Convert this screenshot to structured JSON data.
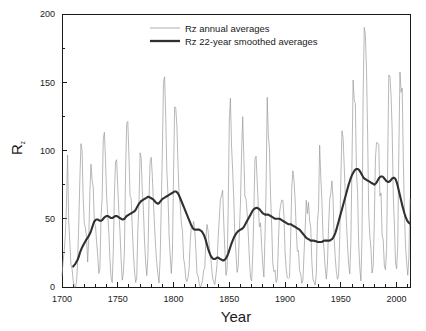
{
  "chart_data": {
    "type": "line",
    "title": "",
    "xlabel": "Year",
    "ylabel": "Rz",
    "ylabel_base": "R",
    "ylabel_sub": "z",
    "xlim": [
      1700,
      2012
    ],
    "ylim": [
      0,
      200
    ],
    "xticks": [
      1700,
      1750,
      1800,
      1850,
      1900,
      1950,
      2000
    ],
    "yticks": [
      0,
      50,
      100,
      150,
      200
    ],
    "xminor_step": 10,
    "yminor_step": 25,
    "grid": false,
    "legend_position": "top-center",
    "colors": {
      "annual": "#9a9a9a",
      "smoothed": "#303030",
      "axis": "#1a1a1a",
      "background": "#ffffff"
    },
    "series": [
      {
        "name": "Rz annual averages",
        "x_start": 1700,
        "x_step": 1,
        "values": [
          8.3,
          18.3,
          26.7,
          38.3,
          60.0,
          96.7,
          48.3,
          33.3,
          16.7,
          13.3,
          5.0,
          0.0,
          0.0,
          3.3,
          18.3,
          45.0,
          78.3,
          105.0,
          100.0,
          65.0,
          46.7,
          43.3,
          36.7,
          18.3,
          35.0,
          70.0,
          90.0,
          78.3,
          73.3,
          46.7,
          45.0,
          33.3,
          23.3,
          10.0,
          13.3,
          51.7,
          65.0,
          108.3,
          113.3,
          93.3,
          66.7,
          53.3,
          40.0,
          20.0,
          6.7,
          3.3,
          26.7,
          68.3,
          91.7,
          93.3,
          73.3,
          55.0,
          40.0,
          20.0,
          5.0,
          10.0,
          26.7,
          85.0,
          120.0,
          121.3,
          96.7,
          66.7,
          65.0,
          43.3,
          25.0,
          11.7,
          3.3,
          6.7,
          41.7,
          60.0,
          98.3,
          94.3,
          70.0,
          56.7,
          33.3,
          18.3,
          8.3,
          21.7,
          64.0,
          92.0,
          95.0,
          81.0,
          61.0,
          44.0,
          29.0,
          17.0,
          9.0,
          3.0,
          21.0,
          60.0,
          100.0,
          150.0,
          154.0,
          125.0,
          85.0,
          68.0,
          38.0,
          23.0,
          10.0,
          24.0,
          83.0,
          132.0,
          131.0,
          118.0,
          90.0,
          67.0,
          60.0,
          47.0,
          41.0,
          21.0,
          16.0,
          6.0,
          4.0,
          7.0,
          14.0,
          34.0,
          45.0,
          43.0,
          48.0,
          42.0,
          28.0,
          10.0,
          8.0,
          2.5,
          0.0,
          1.4,
          5.0,
          12.2,
          13.9,
          35.4,
          45.8,
          41.1,
          30.1,
          23.9,
          15.6,
          6.6,
          4.0,
          1.8,
          8.5,
          16.6,
          36.3,
          49.6,
          64.2,
          67.0,
          70.9,
          47.8,
          27.5,
          8.5,
          13.2,
          56.9,
          121.5,
          138.3,
          103.2,
          85.7,
          64.6,
          36.7,
          24.2,
          10.7,
          15.0,
          40.1,
          61.5,
          98.5,
          124.7,
          96.3,
          66.6,
          64.5,
          54.1,
          39.0,
          20.6,
          6.7,
          4.3,
          22.7,
          54.8,
          93.8,
          95.8,
          77.2,
          59.1,
          44.0,
          47.0,
          30.5,
          16.3,
          7.3,
          37.6,
          74.0,
          139.0,
          111.2,
          101.6,
          66.2,
          44.7,
          17.0,
          11.3,
          12.4,
          3.4,
          6.0,
          32.3,
          54.3,
          59.7,
          63.7,
          63.5,
          52.2,
          25.4,
          13.1,
          6.8,
          6.3,
          7.1,
          35.6,
          73.0,
          85.1,
          78.0,
          64.0,
          41.8,
          26.2,
          26.7,
          12.1,
          9.5,
          2.7,
          5.0,
          24.4,
          42.0,
          63.5,
          53.8,
          62.0,
          48.5,
          43.9,
          18.6,
          5.7,
          3.6,
          1.4,
          9.6,
          47.4,
          57.1,
          103.9,
          80.6,
          63.6,
          37.6,
          26.1,
          14.2,
          5.8,
          16.7,
          44.3,
          63.9,
          69.0,
          77.8,
          64.9,
          35.7,
          21.2,
          11.1,
          5.7,
          8.7,
          36.1,
          79.7,
          114.4,
          109.6,
          88.8,
          67.8,
          47.5,
          30.6,
          16.3,
          9.6,
          33.2,
          92.6,
          151.6,
          136.3,
          134.7,
          83.9,
          69.4,
          31.5,
          13.9,
          4.4,
          38.0,
          141.7,
          190.2,
          184.8,
          159.0,
          112.3,
          53.9,
          37.5,
          27.9,
          10.2,
          15.1,
          47.0,
          93.8,
          105.9,
          105.5,
          104.5,
          66.6,
          68.9,
          38.0,
          34.5,
          15.5,
          12.6,
          27.5,
          92.5,
          155.4,
          154.6,
          140.4,
          115.9,
          66.6,
          45.9,
          17.9,
          13.4,
          29.4,
          100.2,
          157.6,
          142.6,
          145.7,
          94.3,
          54.6,
          29.9,
          17.5,
          8.6,
          21.5,
          64.3,
          93.3,
          119.6,
          111.0,
          104.0,
          63.7,
          40.4,
          29.8,
          15.2,
          7.5,
          2.9,
          3.1,
          16.5,
          55.7,
          57.6,
          64.7
        ]
      },
      {
        "name": "Rz 22-year smoothed averages",
        "x_start": 1710,
        "x_step": 1,
        "values": [
          15.0,
          16.0,
          17.0,
          18.5,
          20.0,
          22.0,
          25.0,
          27.0,
          29.0,
          30.5,
          32.0,
          33.5,
          35.0,
          36.0,
          37.5,
          39.0,
          41.0,
          43.5,
          46.0,
          48.0,
          49.0,
          49.5,
          49.5,
          49.0,
          48.5,
          48.5,
          49.0,
          50.0,
          51.0,
          51.5,
          52.0,
          52.0,
          51.5,
          51.0,
          50.5,
          50.5,
          51.0,
          51.5,
          52.0,
          52.0,
          51.5,
          51.0,
          50.5,
          50.0,
          49.5,
          49.5,
          50.0,
          51.0,
          52.0,
          52.5,
          53.0,
          53.5,
          54.0,
          54.5,
          55.0,
          55.5,
          56.5,
          58.0,
          59.5,
          61.0,
          62.0,
          63.0,
          63.5,
          64.0,
          64.5,
          65.0,
          65.5,
          66.0,
          66.0,
          65.5,
          65.0,
          64.5,
          64.0,
          63.0,
          62.0,
          61.5,
          61.0,
          61.5,
          62.5,
          63.5,
          64.5,
          65.0,
          65.5,
          66.0,
          66.5,
          67.0,
          67.5,
          68.0,
          68.5,
          69.0,
          69.5,
          70.0,
          70.0,
          69.5,
          68.5,
          67.0,
          65.0,
          63.0,
          61.0,
          59.0,
          57.0,
          55.0,
          53.0,
          51.0,
          49.0,
          47.0,
          45.0,
          43.5,
          42.5,
          42.0,
          42.0,
          42.0,
          42.0,
          42.0,
          41.5,
          41.0,
          40.0,
          38.5,
          36.5,
          34.0,
          31.0,
          28.0,
          25.5,
          23.5,
          22.0,
          21.0,
          20.5,
          20.5,
          21.0,
          21.5,
          21.5,
          21.0,
          20.5,
          20.0,
          19.5,
          19.5,
          20.0,
          21.0,
          22.5,
          24.5,
          27.0,
          29.5,
          32.0,
          34.0,
          36.0,
          37.5,
          39.0,
          40.0,
          41.0,
          41.5,
          42.0,
          42.5,
          43.0,
          44.0,
          45.5,
          47.0,
          48.5,
          50.0,
          51.5,
          53.0,
          54.5,
          56.0,
          57.0,
          57.5,
          58.0,
          58.0,
          57.5,
          57.0,
          56.0,
          55.0,
          54.0,
          53.5,
          53.0,
          53.0,
          53.0,
          53.0,
          52.5,
          52.0,
          51.5,
          51.0,
          50.5,
          50.0,
          50.0,
          50.0,
          50.0,
          50.0,
          49.5,
          49.0,
          48.5,
          48.0,
          47.5,
          47.0,
          46.5,
          46.0,
          46.0,
          46.0,
          45.5,
          45.0,
          44.5,
          44.0,
          43.5,
          43.0,
          42.5,
          42.0,
          41.0,
          40.0,
          39.0,
          38.0,
          37.0,
          36.0,
          35.5,
          35.0,
          34.5,
          34.0,
          34.0,
          34.0,
          34.0,
          33.5,
          33.5,
          33.0,
          33.0,
          33.0,
          33.0,
          33.0,
          33.5,
          34.0,
          34.0,
          34.0,
          34.0,
          34.0,
          34.0,
          34.5,
          35.0,
          36.0,
          37.5,
          39.5,
          42.0,
          45.0,
          48.0,
          51.0,
          54.0,
          57.0,
          60.0,
          63.0,
          66.0,
          69.0,
          72.0,
          75.0,
          77.5,
          80.0,
          82.0,
          83.5,
          85.0,
          86.0,
          86.5,
          86.5,
          86.0,
          85.0,
          83.5,
          82.0,
          80.5,
          79.5,
          79.0,
          78.5,
          78.0,
          77.5,
          77.0,
          76.5,
          76.0,
          75.5,
          75.0,
          75.5,
          76.5,
          78.0,
          79.5,
          80.5,
          81.0,
          81.0,
          80.5,
          79.5,
          78.5,
          77.5,
          77.0,
          77.0,
          77.5,
          78.5,
          79.5,
          80.0,
          80.0,
          79.0,
          77.0,
          74.0,
          70.5,
          67.0,
          63.5,
          60.0,
          57.0,
          54.0,
          51.5,
          49.5,
          48.0,
          47.0,
          46.5,
          46.5,
          47.0,
          47.5
        ]
      }
    ]
  },
  "legend": {
    "items": [
      {
        "label": "Rz annual averages",
        "style": "thin-gray"
      },
      {
        "label": "Rz 22-year smoothed averages",
        "style": "thick-dark"
      }
    ]
  },
  "axes": {
    "x_title": "Year",
    "y_title_base": "R",
    "y_title_sub": "z",
    "x_tick_labels": [
      "1700",
      "1750",
      "1800",
      "1850",
      "1900",
      "1950",
      "2000"
    ],
    "y_tick_labels": [
      "0",
      "50",
      "100",
      "150",
      "200"
    ]
  }
}
